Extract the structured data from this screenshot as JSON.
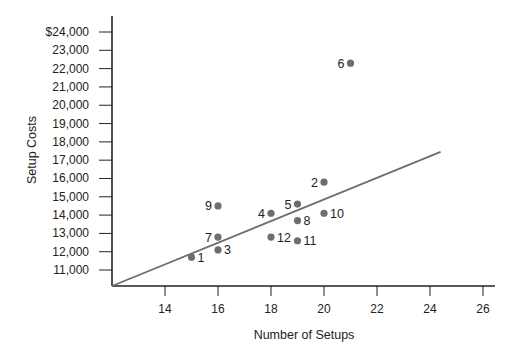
{
  "chart_data": {
    "type": "scatter",
    "title": "",
    "xlabel": "Number of Setups",
    "ylabel": "Setup Costs",
    "xlim": [
      12,
      27
    ],
    "ylim": [
      10000,
      24500
    ],
    "x_ticks": [
      14,
      16,
      18,
      20,
      22,
      24,
      26
    ],
    "x_tick_labels": [
      "14",
      "16",
      "18",
      "20",
      "22",
      "24",
      "26"
    ],
    "y_ticks": [
      24000,
      23000,
      22000,
      21000,
      20000,
      19000,
      18000,
      17000,
      16000,
      15000,
      14000,
      13000,
      12000,
      11000
    ],
    "y_tick_labels": [
      "$24,000",
      "23,000",
      "22,000",
      "21,000",
      "20,000",
      "19,000",
      "18,000",
      "17,000",
      "16,000",
      "15,000",
      "14,000",
      "13,000",
      "12,000",
      "11,000"
    ],
    "grid": false,
    "legend": null,
    "points": [
      {
        "label": "1",
        "x": 15,
        "y": 11700
      },
      {
        "label": "2",
        "x": 20,
        "y": 15800
      },
      {
        "label": "3",
        "x": 16,
        "y": 12100
      },
      {
        "label": "4",
        "x": 18,
        "y": 14100
      },
      {
        "label": "5",
        "x": 19,
        "y": 14600
      },
      {
        "label": "6",
        "x": 21,
        "y": 22300
      },
      {
        "label": "7",
        "x": 16,
        "y": 12800
      },
      {
        "label": "8",
        "x": 19,
        "y": 13700
      },
      {
        "label": "9",
        "x": 16,
        "y": 14500
      },
      {
        "label": "10",
        "x": 20,
        "y": 14100
      },
      {
        "label": "11",
        "x": 19,
        "y": 12600
      },
      {
        "label": "12",
        "x": 18,
        "y": 12800
      }
    ],
    "label_side": {
      "1": "right",
      "2": "left",
      "3": "right",
      "4": "left",
      "5": "left",
      "6": "left",
      "7": "left",
      "8": "right",
      "9": "left",
      "10": "right",
      "11": "right",
      "12": "right"
    },
    "trend_line": {
      "x1": 12,
      "y1": 10000,
      "x2": 24.4,
      "y2": 17450
    },
    "colors": {
      "point": "#6e6e6e",
      "line": "#6e6e6e",
      "axis": "#222222"
    }
  }
}
